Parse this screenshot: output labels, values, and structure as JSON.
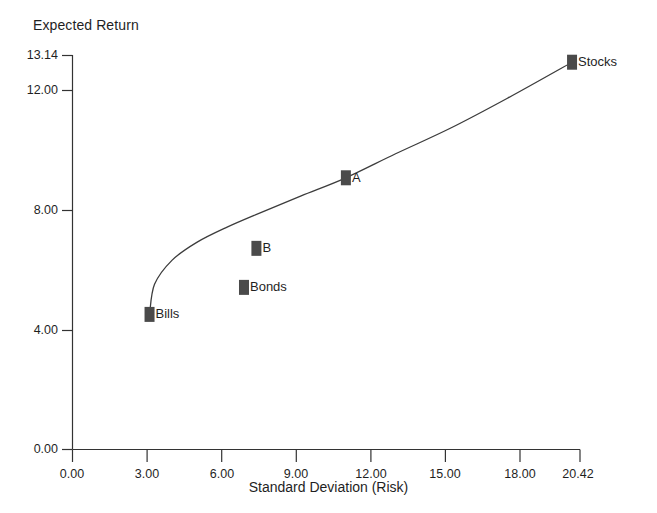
{
  "chart_data": {
    "type": "scatter",
    "title": "",
    "xlabel": "Standard Deviation (Risk)",
    "ylabel": "Expected Return",
    "xlim": [
      0.0,
      20.42
    ],
    "ylim": [
      0.0,
      13.14
    ],
    "grid": false,
    "legend": "none",
    "xticks": [
      "0.00",
      "3.00",
      "6.00",
      "9.00",
      "12.00",
      "15.00",
      "18.00",
      "20.42"
    ],
    "xtick_values": [
      0.0,
      3.0,
      6.0,
      9.0,
      12.0,
      15.0,
      18.0,
      20.42
    ],
    "yticks": [
      "0.00",
      "4.00",
      "8.00",
      "12.00",
      "13.14"
    ],
    "ytick_values": [
      0.0,
      4.0,
      8.0,
      12.0,
      13.14
    ],
    "points": [
      {
        "label": "Bills",
        "x": 3.1,
        "y": 4.5
      },
      {
        "label": "Bonds",
        "x": 6.9,
        "y": 5.4
      },
      {
        "label": "B",
        "x": 7.4,
        "y": 6.7
      },
      {
        "label": "A",
        "x": 11.0,
        "y": 9.05
      },
      {
        "label": "Stocks",
        "x": 20.1,
        "y": 12.9
      }
    ],
    "series": [
      {
        "name": "efficient-frontier-curve",
        "x": [
          3.1,
          3.3,
          4.0,
          5.0,
          6.2,
          7.6,
          9.2,
          11.0,
          13.0,
          15.2,
          17.5,
          20.1
        ],
        "y": [
          4.5,
          5.5,
          6.3,
          6.9,
          7.4,
          7.9,
          8.45,
          9.05,
          9.85,
          10.7,
          11.7,
          12.9
        ]
      }
    ],
    "colors": {
      "marker": "#4a4a4a",
      "curve": "#3c3c3c",
      "axis": "#333333",
      "text": "#1f1f1f",
      "background": "#ffffff"
    }
  }
}
